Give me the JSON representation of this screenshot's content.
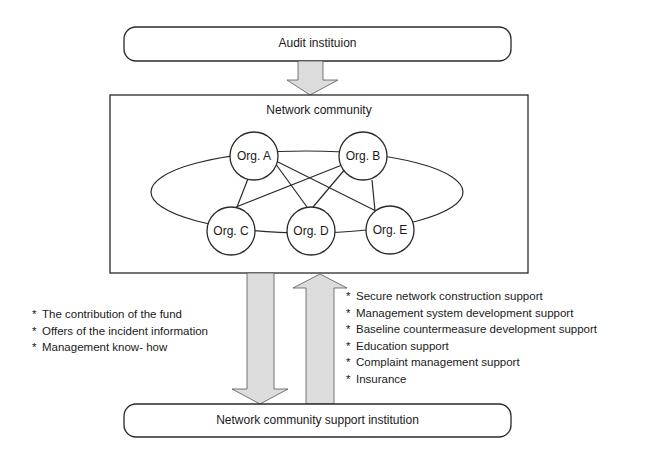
{
  "audit_box": {
    "label": "Audit instituion"
  },
  "community": {
    "title": "Network community",
    "nodes": [
      {
        "id": "A",
        "label": "Org. A"
      },
      {
        "id": "B",
        "label": "Org. B"
      },
      {
        "id": "C",
        "label": "Org. C"
      },
      {
        "id": "D",
        "label": "Org. D"
      },
      {
        "id": "E",
        "label": "Org. E"
      }
    ],
    "edges": [
      [
        "A",
        "B"
      ],
      [
        "A",
        "C"
      ],
      [
        "A",
        "D"
      ],
      [
        "A",
        "E"
      ],
      [
        "B",
        "C"
      ],
      [
        "B",
        "D"
      ],
      [
        "B",
        "E"
      ],
      [
        "C",
        "D"
      ],
      [
        "D",
        "E"
      ]
    ]
  },
  "support_box": {
    "label": "Network community support institution"
  },
  "to_support": {
    "bullet": "*",
    "items": [
      "The contribution of the fund",
      "Offers of the incident information",
      "Management know- how"
    ]
  },
  "from_support": {
    "bullet": "*",
    "items": [
      "Secure network construction support",
      "Management system development support",
      "Baseline countermeasure development support",
      "Education support",
      "Complaint management support",
      "Insurance"
    ]
  },
  "colors": {
    "line": "#2a2a2a",
    "arrow_fill": "#dcdcdc",
    "background": "#ffffff"
  }
}
